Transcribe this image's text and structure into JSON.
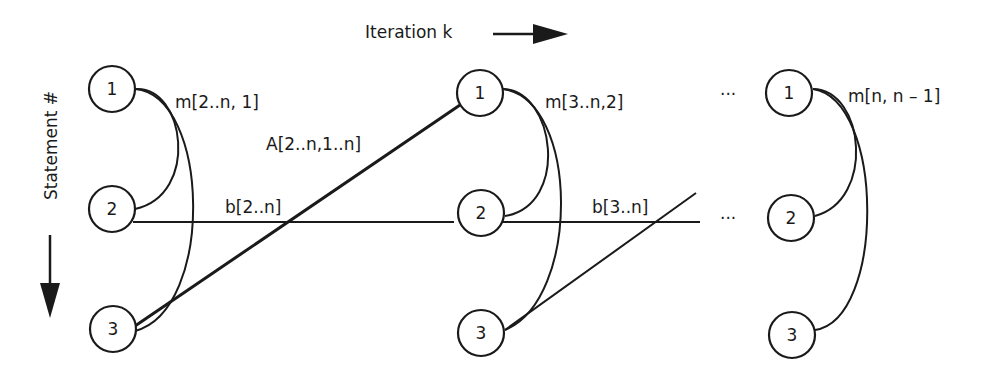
{
  "title": "Iteration k",
  "axis_label": "Statement #",
  "iterations": [
    {
      "nodes": [
        "1",
        "2",
        "3"
      ],
      "dep_label": "m[2..n, 1]",
      "cross_label": "A[2..n,1..n]",
      "flow_label": "b[2..n]"
    },
    {
      "nodes": [
        "1",
        "2",
        "3"
      ],
      "dep_label": "m[3..n,2]",
      "flow_label": "b[3..n]"
    },
    {
      "nodes": [
        "1",
        "2",
        "3"
      ],
      "dep_label": "m[n, n – 1]"
    }
  ],
  "ellipsis": "···",
  "colors": {
    "ink": "#1a1a1a",
    "background": "#ffffff"
  }
}
